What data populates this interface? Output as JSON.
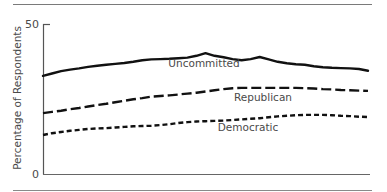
{
  "chart_data": {
    "type": "line",
    "title": "",
    "xlabel": "",
    "ylabel": "Percentage of Respondents",
    "ylim": [
      0,
      50
    ],
    "yticks": [
      "0",
      "50"
    ],
    "grid": false,
    "legend_position": "inline labels",
    "x": [
      0,
      1,
      2,
      3,
      4,
      5,
      6,
      7,
      8,
      9,
      10,
      11,
      12,
      13,
      14,
      15,
      16,
      17,
      18,
      19,
      20,
      21,
      22,
      23,
      24,
      25,
      26,
      27,
      28,
      29,
      30,
      31,
      32,
      33,
      34,
      35,
      36
    ],
    "series": [
      {
        "name": "Uncommitted",
        "style": "solid",
        "values": [
          32.7,
          33.5,
          34.3,
          34.8,
          35.2,
          35.7,
          36.1,
          36.4,
          36.7,
          37.0,
          37.4,
          37.9,
          38.2,
          38.3,
          38.4,
          38.6,
          38.8,
          39.4,
          40.3,
          39.4,
          38.9,
          38.3,
          37.9,
          38.3,
          39.0,
          38.2,
          37.4,
          36.9,
          36.6,
          36.4,
          35.9,
          35.6,
          35.4,
          35.3,
          35.2,
          35.0,
          34.4
        ]
      },
      {
        "name": "Republican",
        "style": "long-dash",
        "values": [
          20.3,
          20.7,
          21.1,
          21.6,
          22.0,
          22.5,
          23.0,
          23.4,
          23.9,
          24.4,
          24.9,
          25.3,
          25.8,
          26.0,
          26.2,
          26.5,
          26.8,
          27.1,
          27.5,
          27.9,
          28.3,
          28.6,
          28.7,
          28.7,
          28.7,
          28.7,
          28.7,
          28.7,
          28.7,
          28.6,
          28.5,
          28.3,
          28.2,
          28.0,
          27.9,
          27.8,
          27.7
        ]
      },
      {
        "name": "Democratic",
        "style": "short-dash",
        "values": [
          13.0,
          13.6,
          14.0,
          14.4,
          14.7,
          15.0,
          15.2,
          15.3,
          15.5,
          15.7,
          15.9,
          16.0,
          16.1,
          16.3,
          16.6,
          17.0,
          17.3,
          17.5,
          17.6,
          17.7,
          17.8,
          18.0,
          18.2,
          18.4,
          18.6,
          18.9,
          19.2,
          19.4,
          19.6,
          19.7,
          19.7,
          19.7,
          19.6,
          19.4,
          19.3,
          19.1,
          19.0
        ]
      }
    ]
  },
  "axis": {
    "y_top_label": "50",
    "y_bottom_label": "0",
    "y_title": "Percentage of Respondents"
  },
  "labels": {
    "uncommitted": "Uncommitted",
    "republican": "Republican",
    "democratic": "Democratic"
  }
}
